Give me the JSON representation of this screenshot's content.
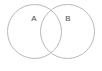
{
  "figure": {
    "type": "venn-diagram",
    "background_color": "#ffffff",
    "stroke_color": "#b9b9b9",
    "label_color": "#4a4a4a",
    "width": 102,
    "height": 71
  },
  "sets": [
    {
      "id": "set-a",
      "label": "A",
      "center_x": 34.5,
      "center_y": 31.5,
      "radius": 27,
      "label_x": 34,
      "label_y": 19
    },
    {
      "id": "set-b",
      "label": "B",
      "center_x": 67.5,
      "center_y": 31.5,
      "radius": 27,
      "label_x": 68,
      "label_y": 19
    }
  ]
}
